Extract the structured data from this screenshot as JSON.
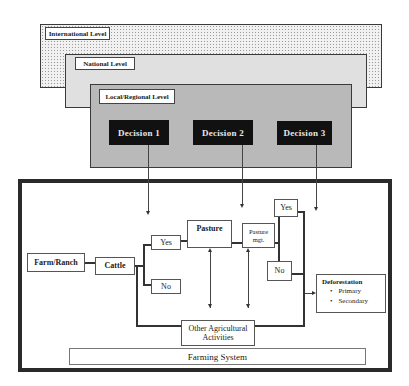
{
  "levels": {
    "international": {
      "label": "International Level"
    },
    "national": {
      "label": "National Level"
    },
    "local": {
      "label": "Local/Regional Level"
    }
  },
  "decisions": [
    {
      "label": "Decision 1"
    },
    {
      "label": "Decision 2"
    },
    {
      "label": "Decision 3"
    }
  ],
  "farming_system": {
    "label": "Farming System",
    "nodes": {
      "farm_ranch": "Farm/Ranch",
      "cattle": "Cattle",
      "yes1": "Yes",
      "no1": "No",
      "pasture": "Pasture",
      "pasture_mgt": "Pasture mgt.",
      "yes2": "Yes",
      "no2": "No",
      "other_ag": "Other Agricultural Activities"
    },
    "deforestation": {
      "title": "Deforestation",
      "items": [
        "Primary",
        "Secondary"
      ]
    }
  }
}
